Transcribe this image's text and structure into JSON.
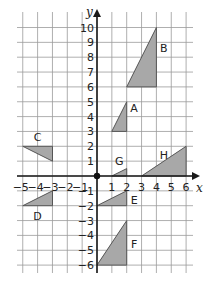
{
  "diagram": {
    "type": "coordinate-grid",
    "x_axis": {
      "label": "x",
      "min": -5,
      "max": 6,
      "ticks": [
        -5,
        -4,
        -3,
        -2,
        -1,
        1,
        2,
        3,
        4,
        5,
        6
      ]
    },
    "y_axis": {
      "label": "y",
      "min": -6,
      "max": 10,
      "ticks": [
        10,
        9,
        8,
        7,
        6,
        5,
        4,
        3,
        2,
        1,
        -1,
        -2,
        -3,
        -4,
        -5,
        -6
      ]
    },
    "origin_marker": true,
    "colors": {
      "fill": "#a8a8a8",
      "grid": "#9a9a9a",
      "axis": "#1a1a1a"
    },
    "shapes": [
      {
        "label": "A",
        "vertices": [
          [
            1,
            3
          ],
          [
            2,
            3
          ],
          [
            2,
            5
          ]
        ],
        "label_pos": [
          2.5,
          4.6
        ]
      },
      {
        "label": "B",
        "vertices": [
          [
            2,
            6
          ],
          [
            4,
            6
          ],
          [
            4,
            10
          ]
        ],
        "label_pos": [
          4.5,
          8.6
        ]
      },
      {
        "label": "C",
        "vertices": [
          [
            -5,
            2
          ],
          [
            -3,
            2
          ],
          [
            -3,
            1
          ]
        ],
        "label_pos": [
          -4.0,
          2.6
        ]
      },
      {
        "label": "D",
        "vertices": [
          [
            -5,
            -2
          ],
          [
            -3,
            -2
          ],
          [
            -3,
            -1
          ]
        ],
        "label_pos": [
          -4.0,
          -2.7
        ]
      },
      {
        "label": "E",
        "vertices": [
          [
            0,
            -2
          ],
          [
            2,
            -2
          ],
          [
            2,
            -1
          ]
        ],
        "label_pos": [
          2.5,
          -1.6
        ]
      },
      {
        "label": "F",
        "vertices": [
          [
            0,
            -6
          ],
          [
            2,
            -6
          ],
          [
            2,
            -3
          ]
        ],
        "label_pos": [
          2.5,
          -4.6
        ]
      },
      {
        "label": "G",
        "vertices": [
          [
            1,
            0
          ],
          [
            2,
            0
          ],
          [
            2,
            0.5
          ]
        ],
        "label_pos": [
          1.5,
          1.0
        ]
      },
      {
        "label": "H",
        "vertices": [
          [
            3,
            0
          ],
          [
            6,
            0
          ],
          [
            6,
            2
          ]
        ],
        "label_pos": [
          4.5,
          1.4
        ]
      }
    ]
  }
}
